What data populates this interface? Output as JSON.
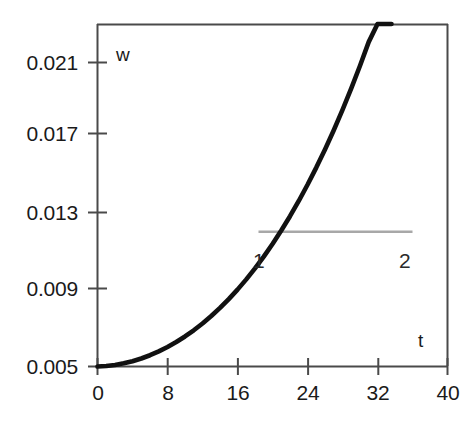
{
  "chart_data": {
    "type": "line",
    "title": "",
    "subtitle": "",
    "xlabel": "t",
    "ylabel": "w",
    "xlim": [
      0,
      40
    ],
    "ylim": [
      0.005,
      0.0229
    ],
    "grid": false,
    "legend_position": "inline-annotations",
    "xticks": [
      0,
      8,
      16,
      24,
      32,
      40
    ],
    "xtick_labels": [
      "0",
      "8",
      "16",
      "24",
      "32",
      "40"
    ],
    "yticks": [
      0.005,
      0.009,
      0.013,
      0.017,
      0.021
    ],
    "ytick_labels": [
      "0.005",
      "0.009",
      "0.013",
      "0.017",
      "0.021"
    ],
    "annotations": [
      {
        "text": "1",
        "x": 22.5,
        "y": 0.0106,
        "series": "curve-1"
      },
      {
        "text": "2",
        "x": 39.0,
        "y": 0.0106,
        "series": "curve-2"
      }
    ],
    "series": [
      {
        "name": "1",
        "style": "solid",
        "color": "#111111",
        "width": 4.6,
        "x": [
          0,
          1,
          2,
          3,
          4,
          5,
          6,
          7,
          8,
          9,
          10,
          11,
          12,
          13,
          14,
          15,
          16,
          17,
          18,
          19,
          20,
          21,
          22,
          23,
          24,
          25,
          26,
          27,
          28,
          29,
          30,
          31,
          32,
          33,
          33.6
        ],
        "values": [
          0.005,
          0.005026,
          0.005082,
          0.005166,
          0.005278,
          0.005419,
          0.005589,
          0.005789,
          0.006018,
          0.006278,
          0.006569,
          0.006892,
          0.007248,
          0.007637,
          0.008061,
          0.008521,
          0.009018,
          0.009553,
          0.010128,
          0.010744,
          0.011403,
          0.012106,
          0.012855,
          0.013651,
          0.014497,
          0.015394,
          0.016344,
          0.017349,
          0.018412,
          0.019534,
          0.020718,
          0.021966,
          0.023281,
          0.024665,
          0.0229
        ]
      },
      {
        "name": "2",
        "style": "solid",
        "color": "#a8a8a8",
        "width": 2.4,
        "x": [
          18.4,
          36.0
        ],
        "values": [
          0.01204,
          0.01204
        ]
      }
    ]
  },
  "axis_names": {
    "y": "w",
    "x": "t"
  }
}
